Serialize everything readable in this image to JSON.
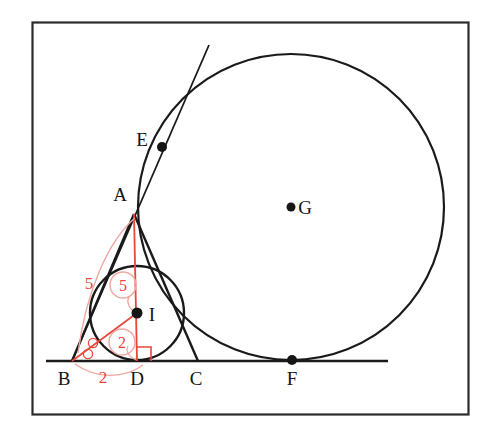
{
  "figure": {
    "frame": {
      "x": 32,
      "y": 22,
      "width": 436,
      "height": 392,
      "stroke": "#2b2b2b"
    },
    "colors": {
      "ink": "#151515",
      "stroke": "#1a1a1a",
      "annotation": "#e8483c",
      "background": "#ffffff"
    },
    "points": [
      {
        "id": "A",
        "label": "A",
        "x": 134,
        "y": 214,
        "label_x": 120,
        "label_y": 201,
        "dot": false
      },
      {
        "id": "B",
        "label": "B",
        "x": 72,
        "y": 361,
        "label_x": 62,
        "label_y": 384,
        "dot": false
      },
      {
        "id": "C",
        "label": "C",
        "x": 198,
        "y": 361,
        "label_x": 190,
        "label_y": 384,
        "dot": false
      },
      {
        "id": "D",
        "label": "D",
        "x": 137,
        "y": 361,
        "label_x": 129,
        "label_y": 384,
        "dot": false
      },
      {
        "id": "E",
        "label": "E",
        "x": 162,
        "y": 147,
        "label_x": 136,
        "label_y": 146,
        "dot": true
      },
      {
        "id": "F",
        "label": "F",
        "x": 292,
        "y": 360,
        "label_x": 285,
        "label_y": 384,
        "dot": true
      },
      {
        "id": "G",
        "label": "G",
        "x": 291,
        "y": 207,
        "label_x": 300,
        "label_y": 214,
        "dot": true
      },
      {
        "id": "I",
        "label": "I",
        "x": 137,
        "y": 313,
        "label_x": 149,
        "label_y": 321,
        "dot": true
      }
    ],
    "circles": [
      {
        "id": "incircle",
        "name": "incircle-of-triangle-ABC",
        "cx": 137,
        "cy": 313,
        "r": 47
      },
      {
        "id": "bigcircle",
        "name": "large-tangent-circle-center-G",
        "cx": 291,
        "cy": 207,
        "r": 153
      }
    ],
    "segments": [
      {
        "id": "BC",
        "name": "baseline-through-B-C-F",
        "x1": 46,
        "y1": 361,
        "x2": 388,
        "y2": 361
      },
      {
        "id": "AB",
        "name": "triangle-side-AB",
        "x1": 134,
        "y1": 214,
        "x2": 72,
        "y2": 361
      },
      {
        "id": "AC",
        "name": "triangle-side-AC",
        "x1": 134,
        "y1": 214,
        "x2": 198,
        "y2": 361
      },
      {
        "id": "tangent",
        "name": "tangent-line-B-through-E",
        "x1": 72,
        "y1": 361,
        "x2": 209,
        "y2": 45
      }
    ],
    "annotations": {
      "altitude_AD": {
        "name": "altitude-AD",
        "x1": 134,
        "y1": 214,
        "x2": 137,
        "y2": 361
      },
      "bisector_BI": {
        "name": "angle-bisector-BI",
        "x1": 72,
        "y1": 361,
        "x2": 137,
        "y2": 313
      },
      "right_angle_marker": {
        "name": "right-angle-marker-at-D",
        "size": 14
      },
      "angle_marks": [
        {
          "name": "equal-angle-mark-upper",
          "cx": 92,
          "cy": 344,
          "r": 4.5
        },
        {
          "name": "equal-angle-mark-lower",
          "cx": 88,
          "cy": 354,
          "r": 4.5
        }
      ],
      "arcs": [
        {
          "name": "arc-measure-AB",
          "d": "M 135 217 C 110 240 88 290 79 352"
        },
        {
          "name": "arc-measure-BD",
          "d": "M 76 364 C 98 378 122 378 140 366"
        },
        {
          "name": "leader-circled-5",
          "d": "M 128 294 C 126 302 130 308 136 312"
        },
        {
          "name": "leader-circled-2",
          "d": "M 127 344 C 125 350 130 356 136 360"
        }
      ]
    },
    "measures": [
      {
        "id": "m-5-side",
        "name": "measure-label-AB",
        "text": "5",
        "x": 88,
        "y": 283,
        "circled": false
      },
      {
        "id": "m-5-alt",
        "name": "measure-label-AD",
        "text": "5",
        "x": 123,
        "y": 290,
        "circled": true,
        "cx": 123,
        "cy": 285,
        "r": 13
      },
      {
        "id": "m-2-inr",
        "name": "measure-label-ID",
        "text": "2",
        "x": 122,
        "y": 347,
        "circled": true,
        "cx": 122,
        "cy": 342,
        "r": 13
      },
      {
        "id": "m-2-base",
        "name": "measure-label-BD",
        "text": "2",
        "x": 103,
        "y": 381,
        "circled": false
      }
    ]
  }
}
